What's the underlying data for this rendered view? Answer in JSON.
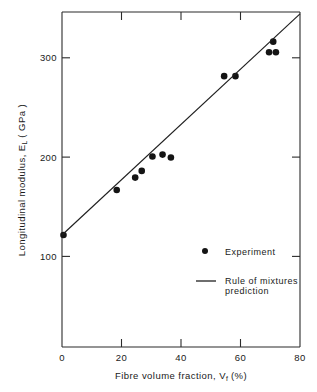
{
  "chart_data": {
    "type": "scatter",
    "title": "",
    "xlabel": "Fibre volume fraction, Vf (%)",
    "xlabel_main": "Fibre  volume  fraction,",
    "xlabel_symbol": "V",
    "xlabel_subscript": "f",
    "xlabel_units": "(%)",
    "ylabel": "Longitudinal modulus, EL (GPa)",
    "ylabel_main": "Longitudinal  modulus,",
    "ylabel_symbol": "E",
    "ylabel_subscript": "L",
    "ylabel_units": "( GPa )",
    "xlim": [
      0,
      80
    ],
    "ylim": [
      0,
      350
    ],
    "xticks": [
      0,
      20,
      40,
      60,
      80
    ],
    "xtick_labels": [
      "0",
      "20",
      "40",
      "60",
      "80"
    ],
    "yticks": [
      100,
      200,
      300
    ],
    "ytick_labels": [
      "100",
      "200",
      "300"
    ],
    "grid": false,
    "legend_position": "center-right-lower",
    "series": [
      {
        "name": "Experiment",
        "marker": "circle",
        "color": "#141414",
        "points": [
          {
            "x": 0.5,
            "y": 117
          },
          {
            "x": 18.4,
            "y": 164
          },
          {
            "x": 24.6,
            "y": 177
          },
          {
            "x": 26.8,
            "y": 184
          },
          {
            "x": 30.4,
            "y": 199
          },
          {
            "x": 33.8,
            "y": 201
          },
          {
            "x": 36.6,
            "y": 198
          },
          {
            "x": 54.5,
            "y": 283
          },
          {
            "x": 58.3,
            "y": 283
          },
          {
            "x": 69.6,
            "y": 308
          },
          {
            "x": 71.9,
            "y": 308
          },
          {
            "x": 71.0,
            "y": 319
          }
        ]
      },
      {
        "name": "Rule of mixtures prediction",
        "marker": "line",
        "color": "#1f1f1f",
        "line": {
          "x0": 0,
          "y0": 117,
          "x1": 80,
          "y1": 348
        }
      }
    ],
    "legend": [
      {
        "label": "Experiment",
        "marker": "circle"
      },
      {
        "label": "Rule of mixtures",
        "label_line2": "prediction",
        "marker": "line"
      }
    ]
  },
  "legend": {
    "experiment_label": "Experiment",
    "prediction_label_line1": "Rule of mixtures",
    "prediction_label_line2": "prediction"
  },
  "axes": {
    "x_tick_0": "0",
    "x_tick_1": "20",
    "x_tick_2": "40",
    "x_tick_3": "60",
    "x_tick_4": "80",
    "y_tick_0": "100",
    "y_tick_1": "200",
    "y_tick_2": "300"
  }
}
